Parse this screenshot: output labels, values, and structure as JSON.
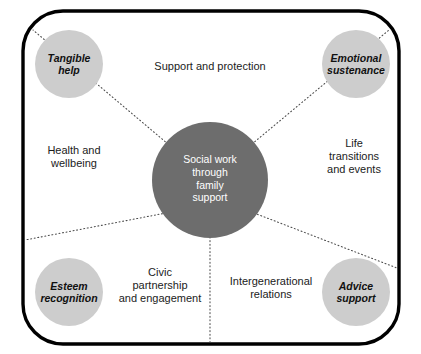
{
  "diagram": {
    "title": "Social work through family support",
    "frame": {
      "shape": "rounded-rectangle",
      "border_color": "#000000"
    },
    "center_node": {
      "label": "Social work\nthrough\nfamily\nsupport",
      "fill": "#6d6d6d",
      "text_color": "#ffffff"
    },
    "corner_nodes": [
      {
        "id": "tangible-help",
        "label": "Tangible\nhelp",
        "fill": "#cdcdcd",
        "position": "top-left"
      },
      {
        "id": "emotional-sustenance",
        "label": "Emotional\nsustenance",
        "fill": "#cdcdcd",
        "position": "top-right"
      },
      {
        "id": "esteem-recognition",
        "label": "Esteem\nrecognition",
        "fill": "#cdcdcd",
        "position": "bottom-left"
      },
      {
        "id": "advice-support",
        "label": "Advice\nsupport",
        "fill": "#cdcdcd",
        "position": "bottom-right"
      }
    ],
    "gap_labels": [
      {
        "id": "support-and-protection",
        "label": "Support and protection",
        "position": "top-center"
      },
      {
        "id": "health-and-wellbeing",
        "label": "Health and\nwellbeing",
        "position": "left-middle"
      },
      {
        "id": "life-transitions-and-events",
        "label": "Life\ntransitions\nand events",
        "position": "right-middle"
      },
      {
        "id": "civic-partnership",
        "label": "Civic\npartnership\nand engagement",
        "position": "bottom-left-center"
      },
      {
        "id": "intergenerational-relations",
        "label": "Intergenerational\nrelations",
        "position": "bottom-right-center"
      }
    ],
    "connectors": {
      "style": "dotted",
      "color": "#4a4a4a",
      "count": 5
    }
  }
}
